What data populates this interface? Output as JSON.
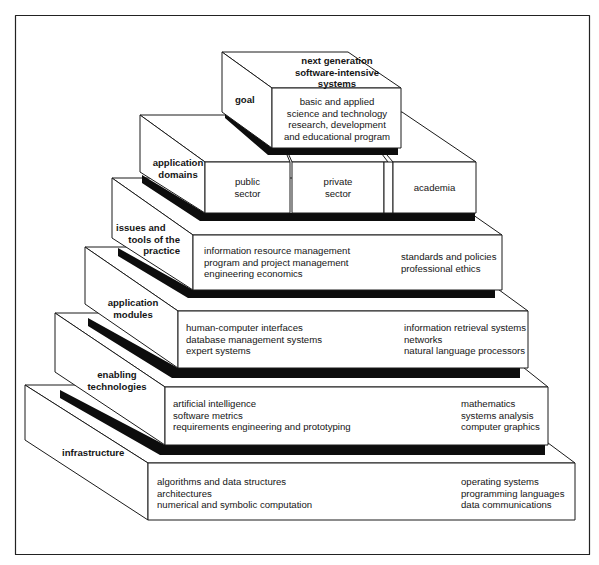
{
  "diagram": {
    "type": "stacked pyramid of layers",
    "layers": [
      {
        "id": "goal",
        "label": "goal",
        "top_label": [
          "next generation",
          "software-intensive",
          "systems"
        ],
        "front_items": [
          "basic and applied",
          "science and technology",
          "research, development",
          "and educational program"
        ]
      },
      {
        "id": "application-domains",
        "label": [
          "application",
          "domains"
        ],
        "boxes": [
          {
            "lines": [
              "public",
              "sector"
            ]
          },
          {
            "lines": [
              "private",
              "sector"
            ]
          },
          {
            "lines": [
              "academia"
            ]
          }
        ]
      },
      {
        "id": "issues-and-tools",
        "label": [
          "issues and",
          "tools of the",
          "practice"
        ],
        "left_items": [
          "information resource management",
          "program and project management",
          "engineering economics"
        ],
        "right_items": [
          "standards and policies",
          "professional ethics"
        ]
      },
      {
        "id": "application-modules",
        "label": [
          "application",
          "modules"
        ],
        "left_items": [
          "human-computer interfaces",
          "database management systems",
          "expert systems"
        ],
        "right_items": [
          "information retrieval systems",
          "networks",
          "natural language processors"
        ]
      },
      {
        "id": "enabling-technologies",
        "label": [
          "enabling",
          "technologies"
        ],
        "left_items": [
          "artificial intelligence",
          "software metrics",
          "requirements engineering and prototyping"
        ],
        "right_items": [
          "mathematics",
          "systems analysis",
          "computer graphics"
        ]
      },
      {
        "id": "infrastructure",
        "label": [
          "infrastructure"
        ],
        "left_items": [
          "algorithms and data structures",
          "architectures",
          "numerical and symbolic computation"
        ],
        "right_items": [
          "operating systems",
          "programming languages",
          "data communications"
        ]
      }
    ]
  },
  "colors": {
    "stroke": "#1a1a1a",
    "shadow": "#0d0d0d",
    "face": "#ffffff",
    "background": "#ffffff"
  }
}
